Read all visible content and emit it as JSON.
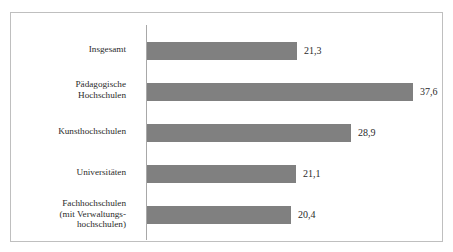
{
  "chart_data": {
    "type": "bar",
    "orientation": "horizontal",
    "title": "",
    "subtitle": "",
    "xlabel": "",
    "ylabel": "",
    "grid": false,
    "legend": null,
    "xlim": [
      0,
      40
    ],
    "axis_line": "vertical category axis at left of bars",
    "decimal_separator": ",",
    "categories": [
      "Insgesamt",
      "Pädagogische\nHochschulen",
      "Kunsthochschulen",
      "Universitäten",
      "Fachhochschulen\n(mit Verwaltungs-\nhochschulen)"
    ],
    "values": [
      21.3,
      37.6,
      28.9,
      21.1,
      20.4
    ],
    "value_labels": [
      "21,3",
      "37,6",
      "28,9",
      "21,1",
      "20,4"
    ],
    "bar_color": "#808080",
    "text_color": "#2b2b2b",
    "frame_color": "#bfbfbf",
    "background": "#ffffff"
  },
  "bars": [
    {
      "label": "Insgesamt",
      "value_label": "21,3",
      "top": 42,
      "height": 18,
      "width": 150,
      "label_top": 44,
      "value_left": 304,
      "value_top": 46
    },
    {
      "label": "Pädagogische\nHochschulen",
      "value_label": "37,6",
      "top": 83,
      "height": 18,
      "width": 266,
      "label_top": 79,
      "value_left": 420,
      "value_top": 87
    },
    {
      "label": "Kunsthochschulen",
      "value_label": "28,9",
      "top": 124,
      "height": 18,
      "width": 204,
      "label_top": 126,
      "value_left": 358,
      "value_top": 128
    },
    {
      "label": "Universitäten",
      "value_label": "21,1",
      "top": 165,
      "height": 18,
      "width": 149,
      "label_top": 167,
      "value_left": 303,
      "value_top": 169
    },
    {
      "label": "Fachhochschulen\n(mit Verwaltungs-\nhochschulen)",
      "value_label": "20,4",
      "top": 206,
      "height": 18,
      "width": 144,
      "label_top": 198,
      "value_left": 298,
      "value_top": 210
    }
  ]
}
